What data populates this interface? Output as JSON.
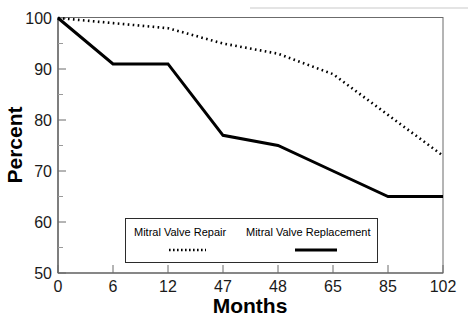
{
  "chart_data": {
    "type": "line",
    "title": "",
    "xlabel": "Months",
    "ylabel": "Percent",
    "ylim": [
      50,
      100
    ],
    "yticks": [
      50,
      60,
      70,
      80,
      90,
      100
    ],
    "ytick_labels": [
      "50",
      "60",
      "70",
      "80",
      "90",
      "100"
    ],
    "yminor_ticks": [
      55,
      65,
      75,
      85,
      95
    ],
    "grid": false,
    "categories": [
      "0",
      "6",
      "12",
      "47",
      "48",
      "65",
      "85",
      "102"
    ],
    "x": [
      0,
      6,
      12,
      47,
      48,
      65,
      85,
      102
    ],
    "x_axis_scale": "categorical",
    "legend_position": "lower-center-inside",
    "series": [
      {
        "name": "Mitral Valve Repair",
        "style": "dotted",
        "color": "#000000",
        "values": [
          100,
          99,
          98,
          95,
          93,
          89,
          81,
          73
        ]
      },
      {
        "name": "Mitral Valve Replacement",
        "style": "solid",
        "color": "#000000",
        "values": [
          100,
          91,
          91,
          77,
          75,
          70,
          65,
          65
        ]
      }
    ]
  },
  "axes": {
    "y_title": "Percent",
    "x_title": "Months"
  },
  "ytick_labels": {
    "t0": "100",
    "t1": "90",
    "t2": "80",
    "t3": "70",
    "t4": "60",
    "t5": "50"
  },
  "xtick_labels": {
    "t0": "0",
    "t1": "6",
    "t2": "12",
    "t3": "47",
    "t4": "48",
    "t5": "65",
    "t6": "85",
    "t7": "102"
  },
  "legend": {
    "entry_1_label": "Mitral Valve Repair",
    "entry_2_label": "Mitral Valve Replacement"
  }
}
